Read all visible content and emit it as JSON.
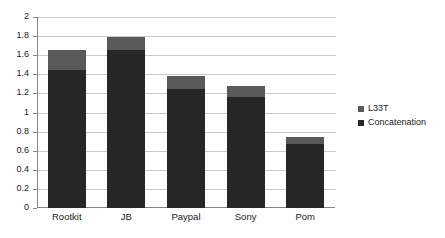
{
  "chart_data": {
    "type": "bar",
    "subtype": "stacked-bar",
    "title": "",
    "xlabel": "",
    "ylabel": "",
    "categories": [
      "Rootkit",
      "JB",
      "Paypal",
      "Sony",
      "Pom"
    ],
    "series": [
      {
        "name": "Concatenation",
        "color": "#262626",
        "values": [
          1.45,
          1.65,
          1.25,
          1.16,
          0.67
        ]
      },
      {
        "name": "L33T",
        "color": "#595959",
        "values": [
          0.2,
          0.14,
          0.13,
          0.12,
          0.075
        ]
      }
    ],
    "stack_order": [
      "Concatenation",
      "L33T"
    ],
    "totals": [
      1.65,
      1.79,
      1.38,
      1.28,
      0.745
    ],
    "ylim": [
      0,
      2
    ],
    "ytick_step": 0.2,
    "ytick_labels": [
      "0",
      "0.2",
      "0.4",
      "0.6",
      "0.8",
      "1",
      "1.2",
      "1.4",
      "1.6",
      "1.8",
      "2"
    ],
    "ytick_values": [
      0,
      0.2,
      0.4,
      0.6,
      0.8,
      1,
      1.2,
      1.4,
      1.6,
      1.8,
      2
    ],
    "grid": {
      "horizontal": true,
      "vertical": false,
      "color": "#c9c9c9"
    },
    "legend": {
      "position": "right",
      "entries": [
        {
          "label": "L33T",
          "color": "#595959"
        },
        {
          "label": "Concatenation",
          "color": "#262626"
        }
      ]
    },
    "axis_color": "#868686",
    "plot_background": "#ffffff"
  }
}
